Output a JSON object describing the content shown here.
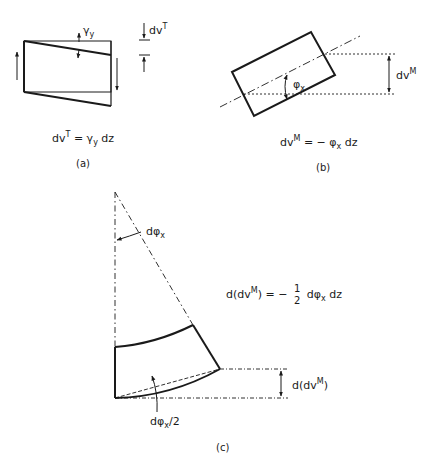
{
  "figure": {
    "panel_a": {
      "caption": "(a)",
      "angle_label": {
        "base": "γ",
        "sub": "y"
      },
      "dimension_label": {
        "base": "dv",
        "sup": "T"
      },
      "equation": {
        "lhs_base": "dv",
        "lhs_sup": "T",
        "rhs": "= γ",
        "rhs_sub": "y",
        "rhs_tail": " dz"
      }
    },
    "panel_b": {
      "caption": "(b)",
      "angle_label": {
        "base": "φ",
        "sub": "x"
      },
      "dimension_label": {
        "base": "dv",
        "sup": "M"
      },
      "equation": {
        "lhs_base": "dv",
        "lhs_sup": "M",
        "rhs": "= − φ",
        "rhs_sub": "x",
        "rhs_tail": " dz"
      }
    },
    "panel_c": {
      "caption": "(c)",
      "apex_angle_label": {
        "base": "dφ",
        "sub": "x"
      },
      "half_angle_label": {
        "base": "dφ",
        "sub": "x",
        "tail": "/2"
      },
      "dimension_label": {
        "pre": "d(dv",
        "sup": "M",
        "post": ")"
      },
      "equation": {
        "lhs_pre": "d(dv",
        "lhs_sup": "M",
        "lhs_post": ") = −",
        "frac_num": "1",
        "frac_den": "2",
        "rhs": "dφ",
        "rhs_sub": "x",
        "rhs_tail": " dz"
      }
    }
  }
}
